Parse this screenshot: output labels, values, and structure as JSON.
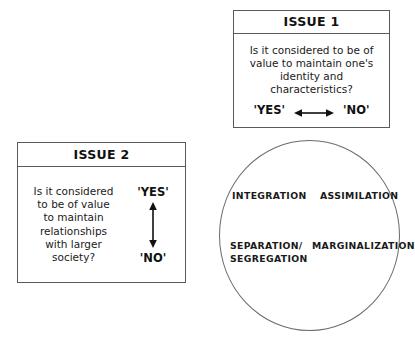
{
  "diagram": {
    "issue1": {
      "title": "ISSUE 1",
      "question": "Is it considered to be of\nvalue to maintain one's\nidentity and\ncharacteristics?",
      "answer_left": "'YES'",
      "answer_right": "'NO'",
      "arrow": "horizontal-double-arrow"
    },
    "issue2": {
      "title": "ISSUE 2",
      "question": "Is it considered\nto be of value\nto maintain\nrelationships\nwith larger\nsociety?",
      "answer_top": "'YES'",
      "answer_bottom": "'NO'",
      "arrow": "vertical-double-arrow"
    },
    "outcomes": {
      "shape": "ellipse",
      "top_left": "INTEGRATION",
      "top_right": "ASSIMILATION",
      "bottom_left": "SEPARATION/\nSEGREGATION",
      "bottom_right": "MARGINALIZATION"
    },
    "colors": {
      "box_border": "#5a5a5a",
      "ellipse_border": "#6b6b6b",
      "text": "#1a1a1a",
      "background": "#ffffff"
    }
  }
}
